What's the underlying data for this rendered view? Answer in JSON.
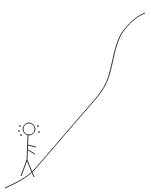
{
  "comic": {
    "description": "Stick figure sweating at the bottom of a steep upward curve",
    "colors": {
      "ink": "#333333",
      "background": "#ffffff"
    },
    "elements": [
      "steep-curve",
      "stick-figure",
      "sweat-drops"
    ]
  }
}
